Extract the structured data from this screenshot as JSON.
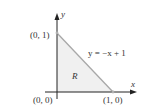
{
  "diagram": {
    "axes": {
      "x_label": "x",
      "y_label": "y"
    },
    "points": [
      {
        "label": "(0, 1)",
        "x": 0,
        "y": 1
      },
      {
        "label": "(0, 0)",
        "x": 0,
        "y": 0
      },
      {
        "label": "(1, 0)",
        "x": 1,
        "y": 0
      }
    ],
    "line_label": "y = −x + 1",
    "region_label": "R",
    "colors": {
      "axis": "#222222",
      "hypotenuse": "#a8a8a8",
      "region_fill": "#f0f0f0"
    }
  }
}
